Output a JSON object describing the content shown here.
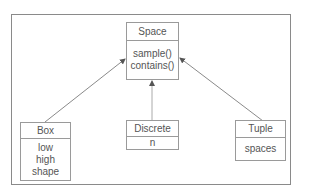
{
  "diagram": {
    "type": "uml-class-diagram",
    "classes": [
      {
        "id": "space",
        "name": "Space",
        "members": [
          "sample()",
          "contains()"
        ]
      },
      {
        "id": "box",
        "name": "Box",
        "members": [
          "low",
          "high",
          "shape"
        ]
      },
      {
        "id": "discrete",
        "name": "Discrete",
        "members": [
          "n"
        ]
      },
      {
        "id": "tuple",
        "name": "Tuple",
        "members": [
          "spaces"
        ]
      }
    ],
    "relations": [
      {
        "from": "Box",
        "to": "Space",
        "kind": "inheritance-arrow"
      },
      {
        "from": "Discrete",
        "to": "Space",
        "kind": "inheritance-arrow"
      },
      {
        "from": "Tuple",
        "to": "Space",
        "kind": "inheritance-arrow"
      }
    ]
  },
  "colors": {
    "line": "#8a8a8a",
    "text": "#555555",
    "background": "#ffffff"
  }
}
